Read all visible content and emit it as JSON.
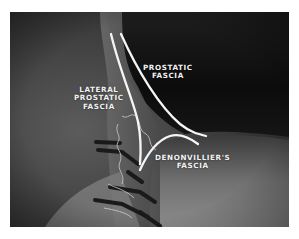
{
  "figure": {
    "labels": {
      "prostatic_fascia": {
        "line1": "PROSTATIC",
        "line2": "FASCIA"
      },
      "lateral_prostatic_fascia": {
        "line1": "LATERAL",
        "line2": "PROSTATIC",
        "line3": "FASCIA"
      },
      "denonvilliers_fascia": {
        "line1": "DENONVILLIER'S",
        "line2": "FASCIA"
      }
    },
    "colors": {
      "background": "#ffffff",
      "tissue_dark": "#141414",
      "tissue_mid": "#4a4a4a",
      "tissue_light": "#8a8a8a",
      "fascia_line": "#f5f5f5",
      "label_text": "#f2f2f2"
    }
  }
}
